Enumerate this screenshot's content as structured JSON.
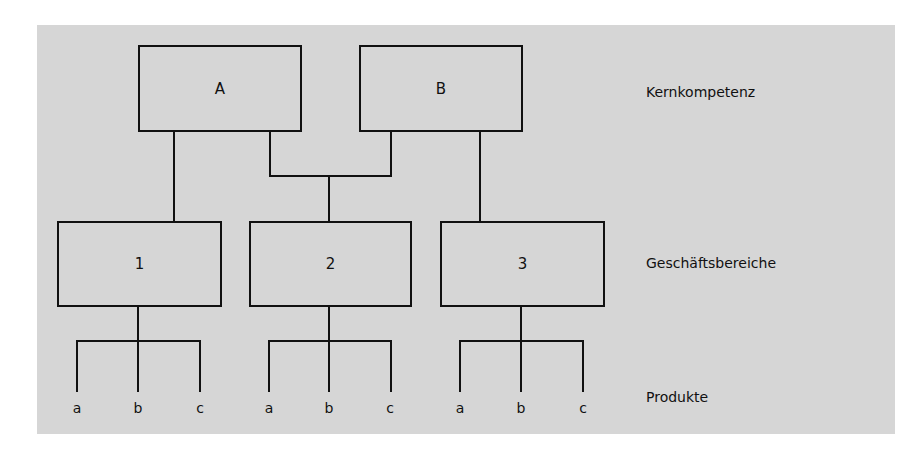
{
  "diagram": {
    "levels": {
      "core": "Kernkompetenz",
      "business": "Geschäftsbereiche",
      "products": "Produkte"
    },
    "core_nodes": [
      {
        "label": "A"
      },
      {
        "label": "B"
      }
    ],
    "business_nodes": [
      {
        "label": "1",
        "products": [
          "a",
          "b",
          "c"
        ]
      },
      {
        "label": "2",
        "products": [
          "a",
          "b",
          "c"
        ]
      },
      {
        "label": "3",
        "products": [
          "a",
          "b",
          "c"
        ]
      }
    ],
    "edges": [
      {
        "from": "A",
        "to": "1"
      },
      {
        "from": "A",
        "to": "2"
      },
      {
        "from": "B",
        "to": "2"
      },
      {
        "from": "B",
        "to": "3"
      }
    ],
    "colors": {
      "background": "#d6d6d6",
      "line": "#111111"
    }
  }
}
